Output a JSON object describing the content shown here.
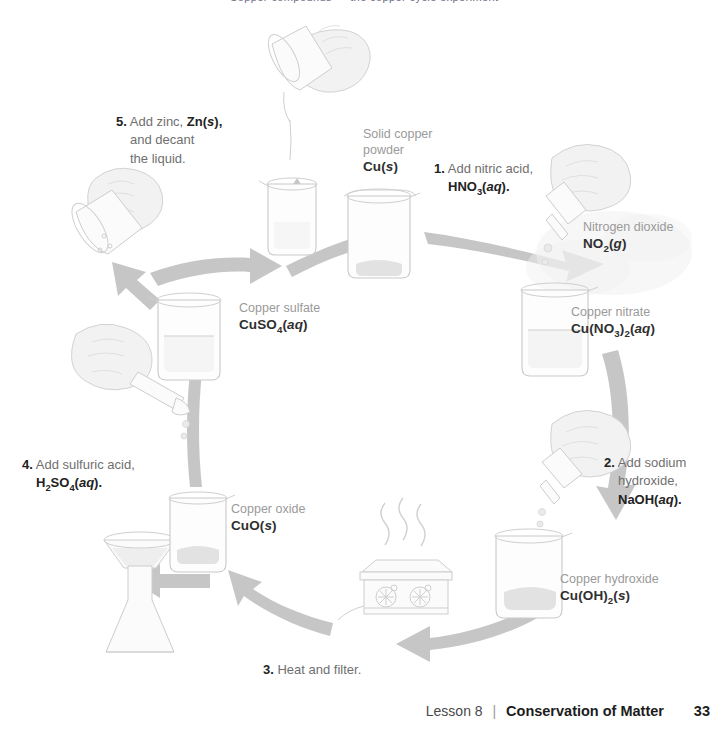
{
  "page": {
    "top_partial_text": "Copper compounds — the copper cycle experiment",
    "background": "#ffffff",
    "arrow_color": "#c6c6c6",
    "label_name_color": "#9a9a9a",
    "formula_color": "#2f2f2f"
  },
  "diagram": {
    "title": "Copper cycle",
    "substances": [
      {
        "id": "copper-powder",
        "name_line1": "Solid copper",
        "name_line2": "powder",
        "formula_html": "Cu(s)",
        "vessel": "beaker"
      },
      {
        "id": "copper-nitrate",
        "name_line1": "Copper nitrate",
        "formula_html": "Cu(NO3)2(aq)",
        "vessel": "beaker"
      },
      {
        "id": "nitrogen-dioxide",
        "name_line1": "Nitrogen dioxide",
        "formula_html": "NO2(g)",
        "vessel": "gas-cloud"
      },
      {
        "id": "copper-hydroxide",
        "name_line1": "Copper hydroxide",
        "formula_html": "Cu(OH)2(s)",
        "vessel": "beaker"
      },
      {
        "id": "copper-oxide",
        "name_line1": "Copper oxide",
        "formula_html": "CuO(s)",
        "vessel": "beaker"
      },
      {
        "id": "copper-sulfate",
        "name_line1": "Copper sulfate",
        "formula_html": "CuSO4(aq)",
        "vessel": "beaker"
      }
    ],
    "steps": [
      {
        "number": "1.",
        "line1": "Add nitric acid,",
        "formula_html": "HNO3(aq).",
        "tool": "dropper"
      },
      {
        "number": "2.",
        "line1": "Add sodium",
        "line2": "hydroxide,",
        "formula_html": "NaOH(aq).",
        "tool": "dropper"
      },
      {
        "number": "3.",
        "line1": "Heat and filter.",
        "tool": "hot-plate"
      },
      {
        "number": "4.",
        "line1": "Add sulfuric acid,",
        "formula_html": "H2SO4(aq).",
        "tool": "dropper"
      },
      {
        "number": "5.",
        "line1": "Add zinc,",
        "formula_html": "Zn(s),",
        "line2": "and decant",
        "line3": "the liquid.",
        "tool": "pouring-beaker"
      }
    ]
  },
  "footer": {
    "lesson": "Lesson 8",
    "separator": "|",
    "title": "Conservation of Matter",
    "page_number": "33"
  }
}
